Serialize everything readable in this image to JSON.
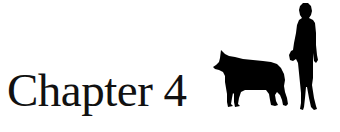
{
  "heading": {
    "text": "Chapter 4"
  },
  "illustration": {
    "figures": [
      "wolf-silhouette",
      "woman-silhouette"
    ],
    "color": "#000000"
  }
}
